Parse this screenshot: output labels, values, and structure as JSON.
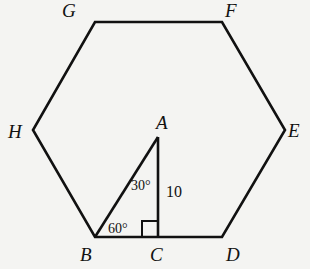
{
  "diagram": {
    "type": "geometry",
    "shape": "regular hexagon with inscribed right triangle",
    "vertices": {
      "G": "G",
      "F": "F",
      "E": "E",
      "D": "D",
      "B": "B",
      "H": "H",
      "A": "A",
      "C": "C"
    },
    "labels": {
      "side_AC": "10",
      "angle_A": "30°",
      "angle_B": "60°"
    },
    "stroke_color": "#111111",
    "background_color": "#f4f4f2"
  }
}
